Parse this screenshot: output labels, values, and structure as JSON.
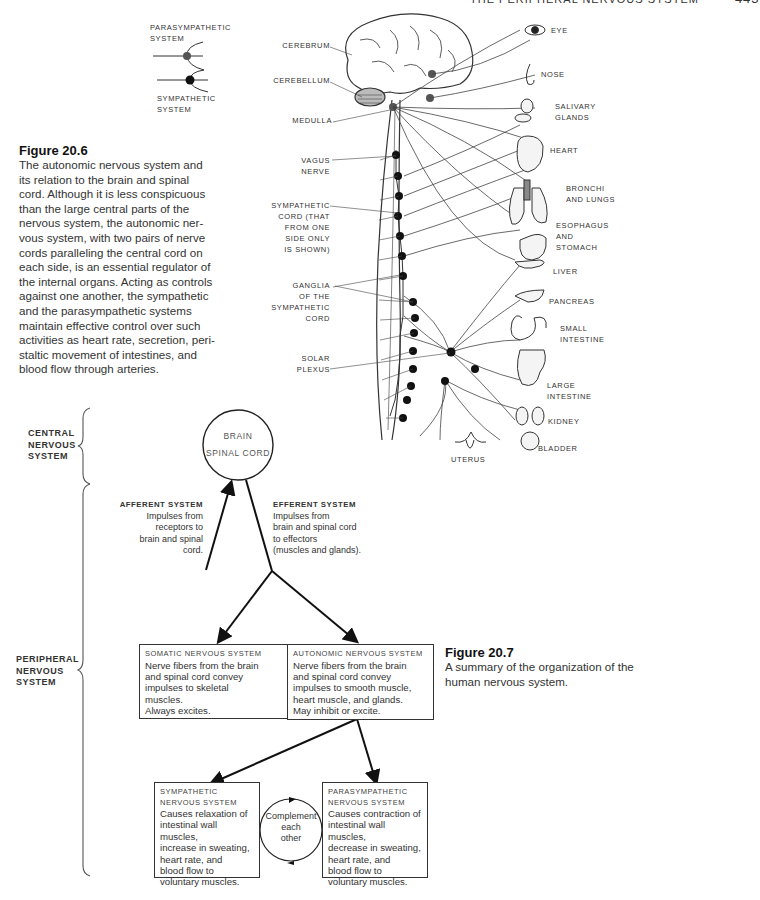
{
  "header": {
    "title": "THE PERIPHERAL NERVOUS SYSTEM",
    "page": "443"
  },
  "legend": {
    "parasympathetic": [
      "PARASYMPATHETIC",
      "SYSTEM"
    ],
    "sympathetic": [
      "SYMPATHETIC",
      "SYSTEM"
    ]
  },
  "figure_20_6": {
    "title": "Figure 20.6",
    "caption": "The autonomic nervous system and its relation to the brain and spinal cord. Although it is less conspicuous than the large central parts of the nervous system, the autonomic nervous system, with two pairs of nerve cords paralleling the central cord on each side, is an essential regulator of the internal organs. Acting as controls against one another, the sympathetic and the parasympathetic systems maintain effective control over such activities as heart rate, secretion, peristaltic movement of intestines, and blood flow through arteries.",
    "caption_lines": [
      "The autonomic nervous system and",
      "its relation to the brain and spinal",
      "cord. Although it is less conspicuous",
      "than the large central parts of the",
      "nervous system, the autonomic ner-",
      "vous system, with two pairs of nerve",
      "cords paralleling the central cord on",
      "each side, is an essential regulator of",
      "the internal organs. Acting as controls",
      "against one another, the sympathetic",
      "and the parasympathetic systems",
      "maintain effective control over such",
      "activities as heart rate, secretion, peri-",
      "staltic movement of intestines, and",
      "blood flow through arteries."
    ],
    "left_labels": {
      "cerebrum": "CEREBRUM",
      "cerebellum": "CEREBELLUM",
      "medulla": "MEDULLA",
      "vagus": [
        "VAGUS",
        "NERVE"
      ],
      "sympathetic_cord": [
        "SYMPATHETIC",
        "CORD (THAT",
        "FROM ONE",
        "SIDE ONLY",
        "IS SHOWN)"
      ],
      "ganglia": [
        "GANGLIA",
        "OF THE",
        "SYMPATHETIC",
        "CORD"
      ],
      "solar_plexus": [
        "SOLAR",
        "PLEXUS"
      ],
      "uterus": "UTERUS"
    },
    "organs": {
      "eye": "EYE",
      "nose": "NOSE",
      "salivary": [
        "SALIVARY",
        "GLANDS"
      ],
      "heart": "HEART",
      "lungs": [
        "BRONCHI",
        "AND LUNGS"
      ],
      "stomach": [
        "ESOPHAGUS",
        "AND",
        "STOMACH"
      ],
      "liver": "LIVER",
      "pancreas": "PANCREAS",
      "small_intestine": [
        "SMALL",
        "INTESTINE"
      ],
      "large_intestine": [
        "LARGE",
        "INTESTINE"
      ],
      "kidney": "KIDNEY",
      "bladder": "BLADDER"
    }
  },
  "figure_20_7": {
    "title": "Figure 20.7",
    "caption_lines": [
      "A summary of the organization of the",
      "human nervous system."
    ],
    "cns_label": [
      "CENTRAL",
      "NERVOUS",
      "SYSTEM"
    ],
    "pns_label": [
      "PERIPHERAL",
      "NERVOUS",
      "SYSTEM"
    ],
    "brain_circle": [
      "BRAIN",
      "SPINAL CORD"
    ],
    "afferent": {
      "title": "AFFERENT SYSTEM",
      "lines": [
        "Impulses from",
        "receptors to",
        "brain and spinal",
        "cord."
      ]
    },
    "efferent": {
      "title": "EFFERENT SYSTEM",
      "lines": [
        "Impulses from",
        "brain and spinal cord",
        "to effectors",
        "(muscles and glands)."
      ]
    },
    "somatic": {
      "title": "SOMATIC NERVOUS SYSTEM",
      "lines": [
        "Nerve fibers from the brain",
        "and spinal cord convey",
        "impulses to skeletal",
        "muscles.",
        "Always excites."
      ]
    },
    "autonomic": {
      "title": "AUTONOMIC NERVOUS SYSTEM",
      "lines": [
        "Nerve fibers from the brain",
        "and spinal cord convey",
        "impulses to smooth muscle,",
        "heart muscle, and glands.",
        "May inhibit or excite."
      ]
    },
    "sympathetic": {
      "title": [
        "SYMPATHETIC",
        "NERVOUS SYSTEM"
      ],
      "lines": [
        "Causes relaxation of",
        "intestinal wall muscles,",
        "increase in sweating,",
        "heart rate, and",
        "blood flow to",
        "voluntary muscles."
      ]
    },
    "parasympathetic": {
      "title": [
        "PARASYMPATHETIC",
        "NERVOUS SYSTEM"
      ],
      "lines": [
        "Causes contraction of",
        "intestinal wall muscles,",
        "decrease in sweating,",
        "heart rate, and",
        "blood flow to",
        "voluntary muscles."
      ]
    },
    "complement": [
      "Complement",
      "each",
      "other"
    ]
  }
}
